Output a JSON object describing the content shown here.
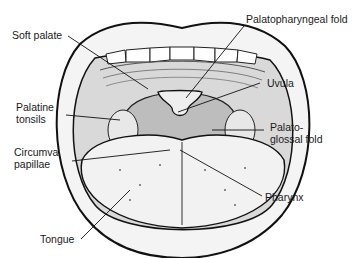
{
  "diagram": {
    "labels": [
      {
        "id": "soft-palate",
        "text": "Soft palate"
      },
      {
        "id": "palatopharyngeal-fold",
        "text": "Palatopharyngeal fold"
      },
      {
        "id": "uvula",
        "text": "Uvula"
      },
      {
        "id": "palatine-tonsils-1",
        "text": "Palatine"
      },
      {
        "id": "palatine-tonsils-2",
        "text": "tonsils"
      },
      {
        "id": "palatoglossal-fold-1",
        "text": "Palato-"
      },
      {
        "id": "palatoglossal-fold-2",
        "text": "glossal fold"
      },
      {
        "id": "circumva-papillae-1",
        "text": "Circumva"
      },
      {
        "id": "circumva-papillae-2",
        "text": "papillae"
      },
      {
        "id": "pharynx",
        "text": "Pharynx"
      },
      {
        "id": "tongue",
        "text": "Tongue"
      }
    ]
  }
}
